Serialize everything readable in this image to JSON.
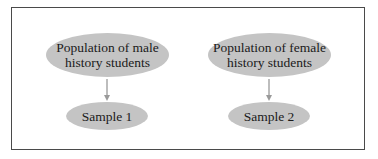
{
  "diagram": {
    "nodes": {
      "population_male": "Population of male history students",
      "population_male_line1": "Population of male",
      "population_male_line2": "history students",
      "population_female_line1": "Population of female",
      "population_female_line2": "history students",
      "sample_1": "Sample 1",
      "sample_2": "Sample 2"
    },
    "edges": [
      {
        "from": "Population of male history students",
        "to": "Sample 1"
      },
      {
        "from": "Population of female history students",
        "to": "Sample 2"
      }
    ],
    "colors": {
      "node_fill": "#c4c4c4",
      "arrow": "#9a9a9a",
      "frame": "#4a4a4a"
    }
  }
}
